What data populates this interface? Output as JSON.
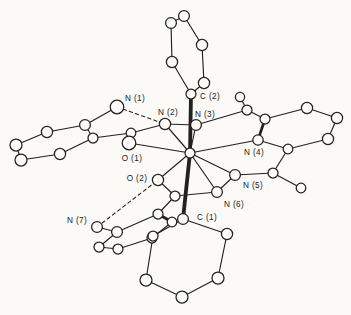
{
  "figure": {
    "type": "molecular-structure-ortep-drawing",
    "description_labels_visible": [
      "N (1)",
      "N (2)",
      "C (2)",
      "N (3)",
      "N (4)",
      "O (1)",
      "O (2)",
      "N (5)",
      "N (6)",
      "N (7)",
      "C (1)"
    ]
  },
  "colors": {
    "ink": "#23201d",
    "paper": "#fbfaf7",
    "atom_fill": "#fdfcfa"
  },
  "structure": {
    "atoms": [
      {
        "id": "P1",
        "x": 171,
        "y": 23,
        "r": 5.4
      },
      {
        "id": "P2",
        "x": 184,
        "y": 16,
        "r": 5.4
      },
      {
        "id": "P3",
        "x": 202,
        "y": 45,
        "r": 5.6
      },
      {
        "id": "P4",
        "x": 204,
        "y": 83,
        "r": 5.6
      },
      {
        "id": "C2",
        "x": 191,
        "y": 94,
        "r": 5.0
      },
      {
        "id": "P5",
        "x": 172,
        "y": 62,
        "r": 5.6
      },
      {
        "id": "M",
        "x": 190,
        "y": 153,
        "r": 5.0
      },
      {
        "id": "N1",
        "x": 117,
        "y": 107,
        "r": 6.8
      },
      {
        "id": "N2",
        "x": 165,
        "y": 124,
        "r": 5.6
      },
      {
        "id": "Ca1",
        "x": 131,
        "y": 133,
        "r": 4.8
      },
      {
        "id": "O1",
        "x": 129,
        "y": 143,
        "r": 6.8
      },
      {
        "id": "A1",
        "x": 93,
        "y": 138,
        "r": 5.0
      },
      {
        "id": "A2",
        "x": 85,
        "y": 125,
        "r": 5.4
      },
      {
        "id": "A3",
        "x": 47,
        "y": 132,
        "r": 5.6
      },
      {
        "id": "A4",
        "x": 16,
        "y": 145,
        "r": 6.0
      },
      {
        "id": "A5",
        "x": 21,
        "y": 160,
        "r": 6.0
      },
      {
        "id": "A6",
        "x": 60,
        "y": 154,
        "r": 5.6
      },
      {
        "id": "N3",
        "x": 196,
        "y": 125,
        "r": 5.4
      },
      {
        "id": "Ca2",
        "x": 247,
        "y": 110,
        "r": 5.0
      },
      {
        "id": "Me1",
        "x": 240,
        "y": 97,
        "r": 4.6
      },
      {
        "id": "Py2",
        "x": 265,
        "y": 119,
        "r": 5.0
      },
      {
        "id": "Py3",
        "x": 307,
        "y": 108,
        "r": 5.6
      },
      {
        "id": "Py4",
        "x": 337,
        "y": 118,
        "r": 5.6
      },
      {
        "id": "Py5",
        "x": 328,
        "y": 139,
        "r": 5.6
      },
      {
        "id": "Py6",
        "x": 288,
        "y": 149,
        "r": 4.8
      },
      {
        "id": "N4",
        "x": 258,
        "y": 140,
        "r": 5.2
      },
      {
        "id": "Cb2",
        "x": 273,
        "y": 173,
        "r": 5.0
      },
      {
        "id": "Me2",
        "x": 301,
        "y": 188,
        "r": 4.8
      },
      {
        "id": "N5",
        "x": 235,
        "y": 175,
        "r": 5.4
      },
      {
        "id": "N6",
        "x": 217,
        "y": 192,
        "r": 5.4
      },
      {
        "id": "Cb1",
        "x": 175,
        "y": 196,
        "r": 5.0
      },
      {
        "id": "O2",
        "x": 158,
        "y": 180,
        "r": 5.6
      },
      {
        "id": "N7",
        "x": 97,
        "y": 227,
        "r": 5.4
      },
      {
        "id": "B1",
        "x": 158,
        "y": 214,
        "r": 5.0
      },
      {
        "id": "B2",
        "x": 117,
        "y": 232,
        "r": 5.4
      },
      {
        "id": "B3",
        "x": 99,
        "y": 247,
        "r": 5.0
      },
      {
        "id": "B4",
        "x": 118,
        "y": 249,
        "r": 5.0
      },
      {
        "id": "B5",
        "x": 152,
        "y": 238,
        "r": 5.0
      },
      {
        "id": "B6",
        "x": 172,
        "y": 222,
        "r": 4.8
      },
      {
        "id": "C1",
        "x": 183,
        "y": 219,
        "r": 5.4
      },
      {
        "id": "Q2",
        "x": 227,
        "y": 234,
        "r": 5.6
      },
      {
        "id": "Q3",
        "x": 218,
        "y": 278,
        "r": 6.0
      },
      {
        "id": "Q4",
        "x": 182,
        "y": 297,
        "r": 6.0
      },
      {
        "id": "Q5",
        "x": 146,
        "y": 280,
        "r": 6.0
      },
      {
        "id": "Q6",
        "x": 153,
        "y": 236,
        "r": 5.0
      }
    ],
    "bonds": [
      {
        "from": "P1",
        "to": "P2",
        "style": "single"
      },
      {
        "from": "P2",
        "to": "P3",
        "style": "single"
      },
      {
        "from": "P3",
        "to": "P4",
        "style": "single"
      },
      {
        "from": "P4",
        "to": "C2",
        "style": "single"
      },
      {
        "from": "C2",
        "to": "P5",
        "style": "single"
      },
      {
        "from": "P5",
        "to": "P1",
        "style": "single"
      },
      {
        "from": "M",
        "to": "C2",
        "style": "thick"
      },
      {
        "from": "M",
        "to": "C1",
        "style": "thick"
      },
      {
        "from": "C1",
        "to": "Q2",
        "style": "single"
      },
      {
        "from": "Q2",
        "to": "Q3",
        "style": "single"
      },
      {
        "from": "Q3",
        "to": "Q4",
        "style": "single"
      },
      {
        "from": "Q4",
        "to": "Q5",
        "style": "single"
      },
      {
        "from": "Q5",
        "to": "Q6",
        "style": "single"
      },
      {
        "from": "Q6",
        "to": "C1",
        "style": "single"
      },
      {
        "from": "A1",
        "to": "A2",
        "style": "single"
      },
      {
        "from": "A2",
        "to": "A3",
        "style": "single"
      },
      {
        "from": "A3",
        "to": "A4",
        "style": "single"
      },
      {
        "from": "A4",
        "to": "A5",
        "style": "single"
      },
      {
        "from": "A5",
        "to": "A6",
        "style": "single"
      },
      {
        "from": "A6",
        "to": "A1",
        "style": "single"
      },
      {
        "from": "N1",
        "to": "A2",
        "style": "single"
      },
      {
        "from": "Ca1",
        "to": "A1",
        "style": "single"
      },
      {
        "from": "Ca1",
        "to": "N2",
        "style": "single"
      },
      {
        "from": "O1",
        "to": "M",
        "style": "single"
      },
      {
        "from": "N2",
        "to": "M",
        "style": "single"
      },
      {
        "from": "N2",
        "to": "N3",
        "style": "single"
      },
      {
        "from": "N3",
        "to": "M",
        "style": "single"
      },
      {
        "from": "N3",
        "to": "Ca2",
        "style": "single"
      },
      {
        "from": "Ca2",
        "to": "Me1",
        "style": "single"
      },
      {
        "from": "Ca2",
        "to": "Py2",
        "style": "single"
      },
      {
        "from": "Py2",
        "to": "Py3",
        "style": "single"
      },
      {
        "from": "Py3",
        "to": "Py4",
        "style": "single"
      },
      {
        "from": "Py4",
        "to": "Py5",
        "style": "single"
      },
      {
        "from": "Py5",
        "to": "Py6",
        "style": "single"
      },
      {
        "from": "Py6",
        "to": "N4",
        "style": "single"
      },
      {
        "from": "N4",
        "to": "Py2",
        "style": "front"
      },
      {
        "from": "N4",
        "to": "M",
        "style": "single"
      },
      {
        "from": "Py6",
        "to": "Cb2",
        "style": "single"
      },
      {
        "from": "Cb2",
        "to": "Me2",
        "style": "single"
      },
      {
        "from": "Cb2",
        "to": "N5",
        "style": "single"
      },
      {
        "from": "N5",
        "to": "M",
        "style": "single"
      },
      {
        "from": "N5",
        "to": "N6",
        "style": "single"
      },
      {
        "from": "N6",
        "to": "M",
        "style": "single"
      },
      {
        "from": "N6",
        "to": "Cb1",
        "style": "single"
      },
      {
        "from": "Cb1",
        "to": "O2",
        "style": "single"
      },
      {
        "from": "O2",
        "to": "M",
        "style": "single"
      },
      {
        "from": "Cb1",
        "to": "B1",
        "style": "single"
      },
      {
        "from": "B1",
        "to": "B2",
        "style": "single"
      },
      {
        "from": "B2",
        "to": "B3",
        "style": "single"
      },
      {
        "from": "B3",
        "to": "B4",
        "style": "single"
      },
      {
        "from": "B4",
        "to": "B5",
        "style": "single"
      },
      {
        "from": "B5",
        "to": "B6",
        "style": "single"
      },
      {
        "from": "B6",
        "to": "B1",
        "style": "front"
      },
      {
        "from": "N7",
        "to": "B2",
        "style": "single"
      },
      {
        "from": "N1",
        "to": "N2",
        "style": "hbond"
      },
      {
        "from": "N7",
        "to": "O2",
        "style": "hbond"
      }
    ],
    "labels": [
      {
        "for": "N1",
        "text": "N (1)",
        "x": 135,
        "y": 98
      },
      {
        "for": "N2",
        "text": "N (2)",
        "x": 168,
        "y": 112
      },
      {
        "for": "C2",
        "text": "C (2)",
        "x": 210,
        "y": 96
      },
      {
        "for": "N3",
        "text": "N (3)",
        "x": 205,
        "y": 114
      },
      {
        "for": "N4",
        "text": "N (4)",
        "x": 254,
        "y": 152
      },
      {
        "for": "O1",
        "text": "O (1)",
        "x": 132,
        "y": 158
      },
      {
        "for": "O2",
        "text": "O (2)",
        "x": 137,
        "y": 178
      },
      {
        "for": "N5",
        "text": "N (5)",
        "x": 253,
        "y": 185
      },
      {
        "for": "N6",
        "text": "N (6)",
        "x": 234,
        "y": 204
      },
      {
        "for": "N7",
        "text": "N (7)",
        "x": 77,
        "y": 220
      },
      {
        "for": "C1",
        "text": "C (1)",
        "x": 207,
        "y": 217
      }
    ]
  }
}
